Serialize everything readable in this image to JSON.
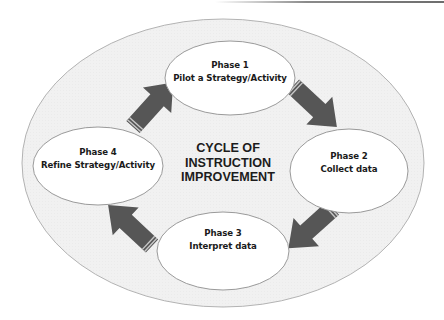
{
  "diagram": {
    "title_lines": [
      "CYCLE OF",
      "INSTRUCTION",
      "IMPROVEMENT"
    ],
    "phases": [
      {
        "phase": "Phase 1",
        "label": "Pilot a Strategy/Activity"
      },
      {
        "phase": "Phase 2",
        "label": "Collect data"
      },
      {
        "phase": "Phase 3",
        "label": "Interpret data"
      },
      {
        "phase": "Phase 4",
        "label": "Refine Strategy/Activity"
      }
    ],
    "arrows": [
      {
        "from": "Phase 1",
        "to": "Phase 2",
        "direction": "down-right"
      },
      {
        "from": "Phase 2",
        "to": "Phase 3",
        "direction": "down-left"
      },
      {
        "from": "Phase 3",
        "to": "Phase 4",
        "direction": "up-left"
      },
      {
        "from": "Phase 4",
        "to": "Phase 1",
        "direction": "up-right"
      }
    ],
    "colors": {
      "outer_fill": "#f1f1f1",
      "outline": "#a9a9a9",
      "node_fill": "#ffffff",
      "arrow": "#555555",
      "text": "#1a1a1a"
    }
  }
}
